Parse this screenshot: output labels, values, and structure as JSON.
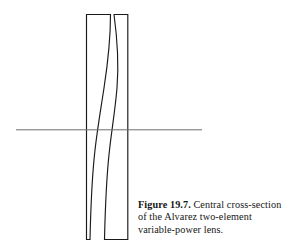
{
  "figure": {
    "label": "Figure 19.7.",
    "caption_text": "Central cross-section of the Alvarez two-element variable-power lens.",
    "caption_lines": [
      "Central cross-section",
      "of the Alvarez two-element",
      "variable-power lens."
    ]
  },
  "diagram": {
    "title": "Central cross-section of the Alvarez two-element variable-power lens",
    "background_color": "#ffffff",
    "outline_color": "#1a1a1a",
    "axis_color": "#6e6e6e",
    "elements": [
      {
        "name": "left-lens-element",
        "outer_edge": "straight-vertical",
        "inner_edge": "s-curve",
        "outer_x": 86,
        "top_y": 14,
        "bottom_y": 240
      },
      {
        "name": "right-lens-element",
        "outer_edge": "straight-vertical",
        "inner_edge": "s-curve",
        "outer_x": 128,
        "top_y": 14,
        "bottom_y": 240
      }
    ],
    "optical_axis": {
      "name": "optical-axis",
      "x_start": 16,
      "x_end": 202,
      "y": 130
    }
  }
}
